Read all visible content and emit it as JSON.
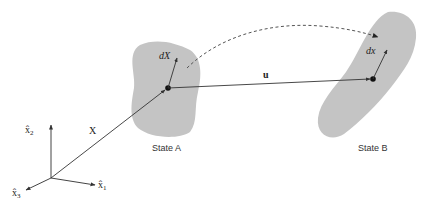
{
  "diagram": {
    "type": "continuum-deformation",
    "colors": {
      "background": "#ffffff",
      "body_fill": "#c4c4c4",
      "line": "#333333",
      "axis": "#444444",
      "dashed": "#555555",
      "point": "#111111"
    },
    "axes": {
      "x1_label": "x̂",
      "x1_sub": "1",
      "x2_label": "x̂",
      "x2_sub": "2",
      "x3_label": "x̂",
      "x3_sub": "3"
    },
    "vectors": {
      "position_label": "X",
      "displacement_label": "u",
      "material_line_label": "dX",
      "spatial_line_label": "dx"
    },
    "states": {
      "a_label": "State A",
      "b_label": "State B"
    }
  }
}
